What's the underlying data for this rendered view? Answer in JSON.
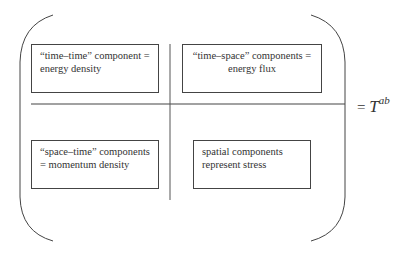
{
  "diagram": {
    "cells": {
      "top_left": {
        "lines": [
          "“time–time” component =",
          "energy density"
        ]
      },
      "top_right": {
        "lines": [
          "“time–space” components =",
          "energy flux"
        ]
      },
      "bottom_left": {
        "lines": [
          "“space–time” components",
          "= momentum density"
        ]
      },
      "bottom_right": {
        "lines": [
          "spatial components",
          "represent stress"
        ]
      }
    },
    "equation": {
      "equals": "=",
      "symbol": "T",
      "superscript": "ab"
    },
    "colors": {
      "lines": "#444444",
      "text": "#333333",
      "background": "#ffffff"
    }
  }
}
